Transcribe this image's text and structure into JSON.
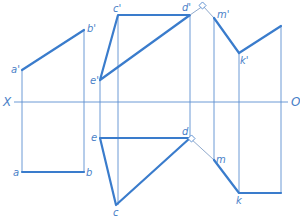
{
  "diagram": {
    "type": "orthographic-projection",
    "axis": {
      "left_label": "X",
      "right_label": "O"
    },
    "colors": {
      "line": "#3a7ccc",
      "projector": "#5b8fd0",
      "label": "#4a7fc8"
    },
    "points": {
      "a_prime": "a'",
      "b_prime": "b'",
      "c_prime": "c'",
      "d_prime": "d'",
      "e_prime": "e'",
      "m_prime": "m'",
      "k_prime": "k'",
      "a": "a",
      "b": "b",
      "c": "c",
      "d": "d",
      "e": "e",
      "m": "m",
      "k": "k"
    }
  }
}
